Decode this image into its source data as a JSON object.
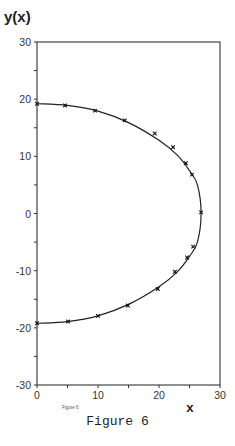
{
  "chart_data": {
    "type": "scatter",
    "title": "",
    "xlabel": "x",
    "ylabel": "y(x)",
    "xlim": [
      0,
      30
    ],
    "ylim": [
      -30,
      30
    ],
    "x_ticks": [
      0,
      10,
      20,
      30
    ],
    "y_ticks": [
      30,
      20,
      10,
      0,
      -10,
      -20,
      -30
    ],
    "grid": false,
    "legend": null,
    "inner_label": "Figure 6",
    "caption": "Figure 6",
    "series": [
      {
        "name": "data",
        "style": "markers",
        "x": [
          0,
          4.6,
          9.5,
          14.4,
          19.3,
          22.3,
          24.4,
          25.4,
          26.9,
          25.6,
          24.6,
          22.6,
          19.8,
          14.9,
          10.0,
          5.1,
          0
        ],
        "y": [
          19.2,
          18.9,
          18.0,
          16.3,
          14.0,
          11.6,
          8.8,
          6.8,
          0.2,
          -5.8,
          -7.7,
          -10.2,
          -13.2,
          -16.1,
          -17.9,
          -18.9,
          -19.2
        ]
      },
      {
        "name": "fit",
        "style": "line",
        "x": [
          0,
          5,
          10,
          15,
          20,
          23,
          25,
          26.3,
          26.9,
          26.3,
          25,
          23,
          20,
          15,
          10,
          5,
          0
        ],
        "y": [
          19.2,
          18.9,
          17.9,
          15.9,
          12.8,
          10.2,
          7.5,
          5.0,
          0,
          -5.0,
          -7.5,
          -10.2,
          -12.8,
          -15.9,
          -17.9,
          -18.9,
          -19.2
        ]
      }
    ]
  },
  "labels": {
    "ylabel": "y(x)",
    "xlabel": "x",
    "inner": "Figure 6",
    "caption": "Figure 6",
    "yticks": [
      "30",
      "20",
      "10",
      "0",
      "-10",
      "-20",
      "-30"
    ],
    "xticks": [
      "0",
      "10",
      "20",
      "30"
    ]
  }
}
